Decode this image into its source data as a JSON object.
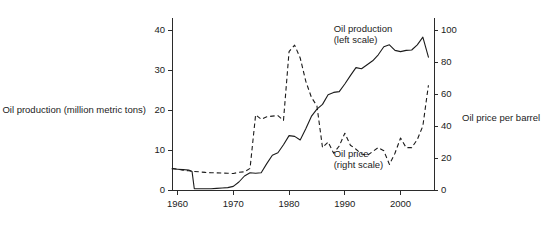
{
  "chart_data": {
    "type": "line",
    "title": "",
    "xlabel": "",
    "ylabel": "Oil production (million metric tons)",
    "y2label": "Oil price per barrel",
    "xlim": [
      1959,
      2006
    ],
    "ylim": [
      0,
      42
    ],
    "y2lim": [
      0,
      105
    ],
    "grid": false,
    "legend_position": "inline-annotations",
    "xticks": [
      1960,
      1970,
      1980,
      1990,
      2000
    ],
    "xtick_labels": [
      "1960",
      "1970",
      "1980",
      "1990",
      "2000"
    ],
    "yticks": [
      0,
      10,
      20,
      30,
      40
    ],
    "ytick_labels": [
      "0",
      "10",
      "20",
      "30",
      "40"
    ],
    "y2ticks": [
      0,
      20,
      40,
      60,
      80,
      100
    ],
    "y2tick_labels": [
      "0",
      "20",
      "40",
      "60",
      "80",
      "100"
    ],
    "annotations": [
      {
        "name": "oil-production-annotation",
        "line1": "Oil production",
        "line2": "(left scale)",
        "x": 1988,
        "y": 39.5
      },
      {
        "name": "oil-price-annotation",
        "line1": "Oil price",
        "line2": "(right scale)",
        "x": 1988,
        "y": 8.2
      }
    ],
    "series": [
      {
        "name": "Oil production",
        "axis": "left",
        "style": "solid",
        "x": [
          1959,
          1960,
          1961,
          1962,
          1962.6,
          1963,
          1964,
          1965,
          1966,
          1967,
          1968,
          1969,
          1970,
          1971,
          1972,
          1973,
          1974,
          1975,
          1976,
          1977,
          1978,
          1979,
          1980,
          1981,
          1982,
          1983,
          1984,
          1985,
          1986,
          1987,
          1988,
          1989,
          1990,
          1991,
          1992,
          1993,
          1994,
          1995,
          1996,
          1997,
          1998,
          1999,
          2000,
          2001,
          2002,
          2003,
          2004,
          2005
        ],
        "values": [
          5.3,
          5.2,
          5.1,
          5.0,
          4.6,
          0.3,
          0.3,
          0.3,
          0.3,
          0.4,
          0.5,
          0.6,
          0.9,
          2.0,
          3.5,
          4.3,
          4.2,
          4.3,
          6.6,
          8.7,
          9.3,
          11.3,
          13.6,
          13.4,
          12.5,
          15.3,
          18.4,
          20.2,
          21.4,
          23.8,
          24.4,
          24.6,
          26.5,
          28.6,
          30.6,
          30.3,
          31.3,
          32.3,
          33.8,
          35.8,
          36.3,
          34.9,
          34.6,
          34.9,
          35.0,
          36.3,
          38.2,
          33.2
        ]
      },
      {
        "name": "Oil price",
        "axis": "right",
        "style": "dashed",
        "x": [
          1959,
          1960,
          1961,
          1962,
          1963,
          1964,
          1965,
          1966,
          1967,
          1968,
          1969,
          1970,
          1971,
          1972,
          1973,
          1974,
          1975,
          1976,
          1977,
          1978,
          1979,
          1980,
          1981,
          1982,
          1983,
          1984,
          1985,
          1986,
          1987,
          1988,
          1989,
          1990,
          1991,
          1992,
          1993,
          1994,
          1995,
          1996,
          1997,
          1998,
          1999,
          2000,
          2001,
          2002,
          2003,
          2004,
          2005
        ],
        "values": [
          13.5,
          13.0,
          12.4,
          12.0,
          11.6,
          11.3,
          11.0,
          10.8,
          10.7,
          10.6,
          10.5,
          10.3,
          11.1,
          11.4,
          13.5,
          47.0,
          44.2,
          45.8,
          46.2,
          46.5,
          43.5,
          86.5,
          90.5,
          82.5,
          68.0,
          58.0,
          52.5,
          26.5,
          30.0,
          23.0,
          27.5,
          35.5,
          28.0,
          25.5,
          22.5,
          21.5,
          24.0,
          26.5,
          24.5,
          16.0,
          23.0,
          32.5,
          26.5,
          26.5,
          31.5,
          40.0,
          65.5
        ]
      }
    ]
  }
}
